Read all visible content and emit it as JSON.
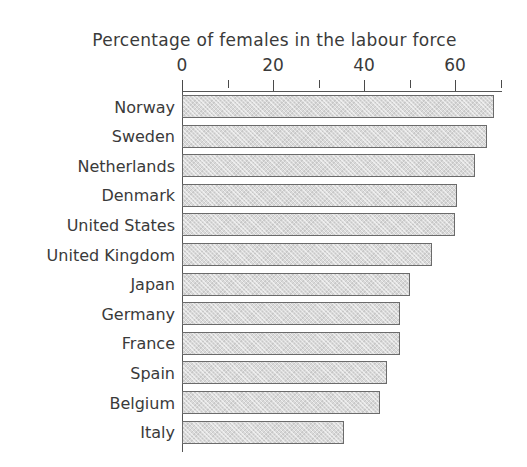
{
  "chart_data": {
    "type": "bar",
    "orientation": "horizontal",
    "title": "Percentage of females in the labour force",
    "xlabel": "",
    "ylabel": "",
    "xlim": [
      0,
      70
    ],
    "grid": false,
    "legend": null,
    "xticks": [
      0,
      20,
      40,
      60
    ],
    "xtick_labels": [
      "0",
      "20",
      "40",
      "60"
    ],
    "minor_xticks": [
      10,
      30,
      50,
      70
    ],
    "categories": [
      "Norway",
      "Sweden",
      "Netherlands",
      "Denmark",
      "United States",
      "United Kingdom",
      "Japan",
      "Germany",
      "France",
      "Spain",
      "Belgium",
      "Italy"
    ],
    "values": [
      68.5,
      67.0,
      64.5,
      60.5,
      60.0,
      55.0,
      50.0,
      48.0,
      48.0,
      45.0,
      43.5,
      35.5
    ],
    "bar_color": "#d9d9d9",
    "bar_edge_color": "#6b6b6b",
    "axis_color": "#555555",
    "text_color": "#3a3a3a",
    "background": "#ffffff"
  },
  "geometry": {
    "axis_x0_px": 182,
    "px_per_unit": 4.55,
    "axis_top_px": 91,
    "axis_bottom_px": 452,
    "bar_pitch_px": 29.6,
    "bar_height_px": 23,
    "first_bar_top_px": 95,
    "axis_right_end_px": 502
  }
}
